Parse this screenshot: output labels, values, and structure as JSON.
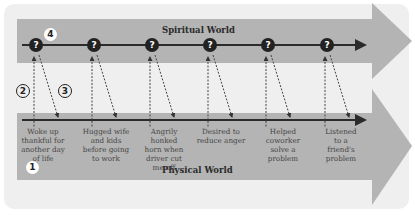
{
  "diagram": {
    "spiritual_world": {
      "title": "Spiritual World"
    },
    "physical_world": {
      "title": "Physical World"
    },
    "node_symbol": "?",
    "events": [
      {
        "label": "Woke up thankful for another day of life"
      },
      {
        "label": "Hugged wife and kids before going to work"
      },
      {
        "label": "Angrily honked horn when driver cut me off"
      },
      {
        "label": "Desired to reduce anger"
      },
      {
        "label": "Helped coworker solve a problem"
      },
      {
        "label": "Listened to a friend's problem"
      }
    ],
    "callouts": [
      {
        "number": "1",
        "refers_to": "physical-world"
      },
      {
        "number": "2",
        "refers_to": "upward-dashed-arrow"
      },
      {
        "number": "3",
        "refers_to": "downward-dashed-arrow"
      },
      {
        "number": "4",
        "refers_to": "spiritual-node"
      }
    ],
    "colors": {
      "panel": "#efefef",
      "band": "#b4b4b4",
      "arrow_head": "#b4b4b4",
      "timeline": "#2b2b2b",
      "node": "#222222",
      "node_text": "#ffffff"
    }
  }
}
